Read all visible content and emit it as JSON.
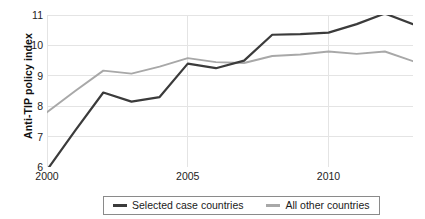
{
  "chart_data": {
    "type": "line",
    "title": "",
    "xlabel": "",
    "ylabel": "Anti-TIP policy index",
    "x": [
      2000,
      2001,
      2002,
      2003,
      2004,
      2005,
      2006,
      2007,
      2008,
      2009,
      2010,
      2011,
      2012,
      2013
    ],
    "xlim": [
      2000,
      2013
    ],
    "ylim": [
      6,
      11
    ],
    "x_ticks": [
      2000,
      2005,
      2010
    ],
    "x_tick_labels": [
      "2000",
      "2005",
      "2010"
    ],
    "y_ticks": [
      6,
      7,
      8,
      9,
      10,
      11
    ],
    "y_tick_labels": [
      "6",
      "7",
      "8",
      "9",
      "10",
      "11"
    ],
    "grid": true,
    "grid_axis": "both",
    "legend_position": "bottom",
    "series": [
      {
        "name": "Selected case countries",
        "color": "#3b3b3b",
        "values": [
          5.9,
          7.2,
          8.45,
          8.15,
          8.3,
          9.4,
          9.25,
          9.5,
          10.35,
          10.37,
          10.42,
          10.7,
          11.05,
          10.7
        ]
      },
      {
        "name": "All other countries",
        "color": "#a8a8a8",
        "values": [
          7.8,
          8.5,
          9.17,
          9.07,
          9.3,
          9.58,
          9.45,
          9.42,
          9.65,
          9.7,
          9.8,
          9.72,
          9.8,
          9.48
        ]
      }
    ]
  },
  "legend": {
    "entries": [
      {
        "label": "Selected case countries"
      },
      {
        "label": "All other countries"
      }
    ]
  },
  "colors": {
    "series_dark": "#3b3b3b",
    "series_light": "#a8a8a8",
    "grid": "#e4e4e4",
    "text": "#232323",
    "legend_border": "#8a8a8a"
  }
}
